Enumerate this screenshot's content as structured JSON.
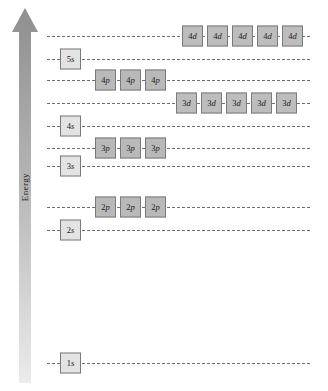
{
  "figure": {
    "axis": {
      "label": "Energy",
      "direction": "up",
      "arrow_color": "#9a9a9a"
    },
    "colors": {
      "s_box_fill": "#e3e3e3",
      "p_box_fill": "#b9b9b9",
      "d_box_fill": "#bdbdbd",
      "box_border": "#7a7a7a",
      "level_line": "#6f6f6f",
      "background": "#ffffff"
    }
  },
  "chart_data": {
    "type": "diagram",
    "xlabel": "",
    "ylabel": "Energy",
    "levels": [
      {
        "id": "4d",
        "shell": 4,
        "subshell": "d",
        "y": 36,
        "box_left": 182,
        "count": 5,
        "boxes": [
          {
            "n": "4",
            "l": "d"
          },
          {
            "n": "4",
            "l": "d"
          },
          {
            "n": "4",
            "l": "d"
          },
          {
            "n": "4",
            "l": "d"
          },
          {
            "n": "4",
            "l": "d"
          }
        ]
      },
      {
        "id": "5s",
        "shell": 5,
        "subshell": "s",
        "y": 59,
        "box_left": 60,
        "count": 1,
        "boxes": [
          {
            "n": "5",
            "l": "s"
          }
        ]
      },
      {
        "id": "4p",
        "shell": 4,
        "subshell": "p",
        "y": 80,
        "box_left": 95,
        "count": 3,
        "boxes": [
          {
            "n": "4",
            "l": "p"
          },
          {
            "n": "4",
            "l": "p"
          },
          {
            "n": "4",
            "l": "p"
          }
        ]
      },
      {
        "id": "3d",
        "shell": 3,
        "subshell": "d",
        "y": 103,
        "box_left": 176,
        "count": 5,
        "boxes": [
          {
            "n": "3",
            "l": "d"
          },
          {
            "n": "3",
            "l": "d"
          },
          {
            "n": "3",
            "l": "d"
          },
          {
            "n": "3",
            "l": "d"
          },
          {
            "n": "3",
            "l": "d"
          }
        ]
      },
      {
        "id": "4s",
        "shell": 4,
        "subshell": "s",
        "y": 126,
        "box_left": 60,
        "count": 1,
        "boxes": [
          {
            "n": "4",
            "l": "s"
          }
        ]
      },
      {
        "id": "3p",
        "shell": 3,
        "subshell": "p",
        "y": 148,
        "box_left": 95,
        "count": 3,
        "boxes": [
          {
            "n": "3",
            "l": "p"
          },
          {
            "n": "3",
            "l": "p"
          },
          {
            "n": "3",
            "l": "p"
          }
        ]
      },
      {
        "id": "3s",
        "shell": 3,
        "subshell": "s",
        "y": 166,
        "box_left": 60,
        "count": 1,
        "boxes": [
          {
            "n": "3",
            "l": "s"
          }
        ]
      },
      {
        "id": "2p",
        "shell": 2,
        "subshell": "p",
        "y": 207,
        "box_left": 95,
        "count": 3,
        "boxes": [
          {
            "n": "2",
            "l": "p"
          },
          {
            "n": "2",
            "l": "p"
          },
          {
            "n": "2",
            "l": "p"
          }
        ]
      },
      {
        "id": "2s",
        "shell": 2,
        "subshell": "s",
        "y": 230,
        "box_left": 60,
        "count": 1,
        "boxes": [
          {
            "n": "2",
            "l": "s"
          }
        ]
      },
      {
        "id": "1s",
        "shell": 1,
        "subshell": "s",
        "y": 363,
        "box_left": 60,
        "count": 1,
        "boxes": [
          {
            "n": "1",
            "l": "s"
          }
        ]
      }
    ]
  }
}
